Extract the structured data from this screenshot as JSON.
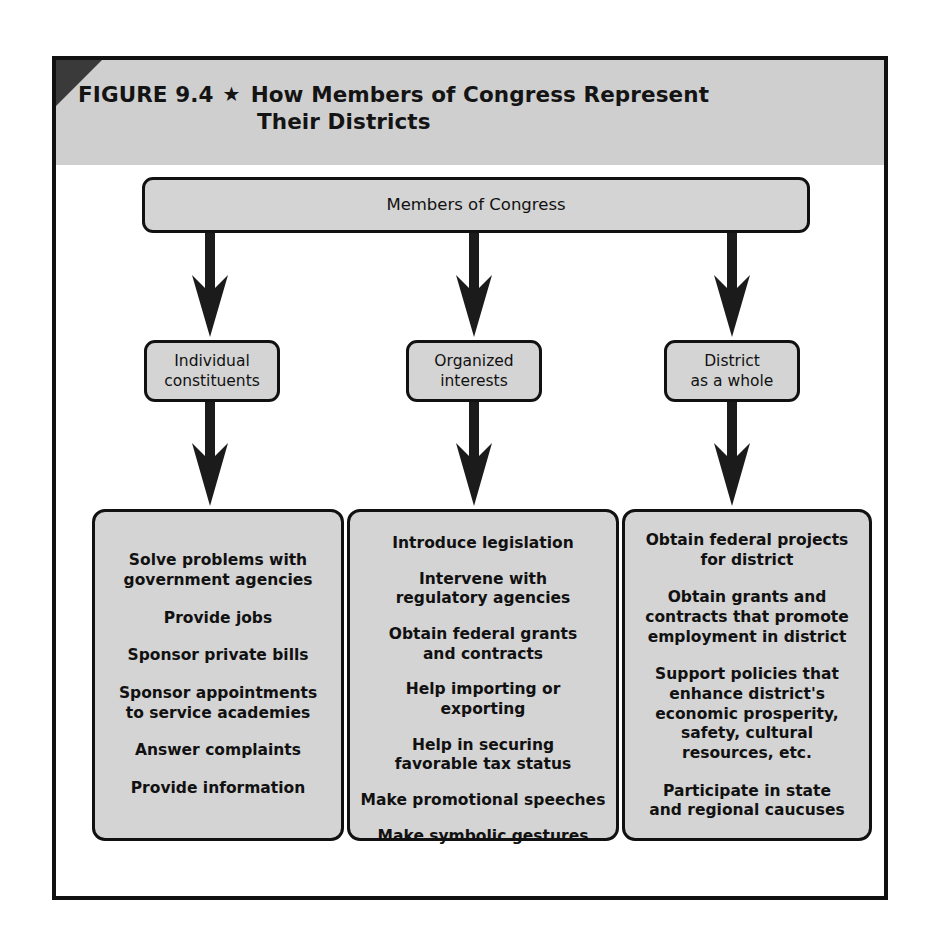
{
  "figure": {
    "label": "FIGURE 9.4",
    "star_icon": "star-icon",
    "star_glyph": "★",
    "title_line1": "How Members of Congress Represent",
    "title_line2": "Their Districts",
    "header_bg": "#cfcfcf",
    "node_bg": "#d4d4d4",
    "line_color": "#111111",
    "corner_fold_color": "#3a3a3a"
  },
  "diagram": {
    "type": "flowchart",
    "root": {
      "label": "Members of Congress"
    },
    "branches": [
      {
        "id": "individual-constituents",
        "label": "Individual\nconstituents",
        "label_line1": "Individual",
        "label_line2": "constituents",
        "items": [
          "Solve problems with\ngovernment agencies",
          "Provide jobs",
          "Sponsor private bills",
          "Sponsor appointments\nto service academies",
          "Answer complaints",
          "Provide information"
        ]
      },
      {
        "id": "organized-interests",
        "label": "Organized\ninterests",
        "label_line1": "Organized",
        "label_line2": "interests",
        "items": [
          "Introduce legislation",
          "Intervene with\nregulatory agencies",
          "Obtain federal grants\nand contracts",
          "Help importing or\nexporting",
          "Help in securing\nfavorable tax status",
          "Make promotional speeches",
          "Make symbolic gestures"
        ]
      },
      {
        "id": "district-as-a-whole",
        "label": "District\nas a whole",
        "label_line1": "District",
        "label_line2": "as a whole",
        "items": [
          "Obtain federal projects\nfor district",
          "Obtain grants and\ncontracts that promote\nemployment in district",
          "Support policies that\nenhance district's\neconomic prosperity,\nsafety, cultural\nresources, etc.",
          "Participate in state\nand regional caucuses"
        ]
      }
    ]
  }
}
